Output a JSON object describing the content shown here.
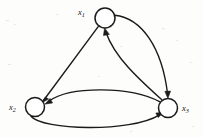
{
  "diagram": {
    "type": "directed-graph",
    "title": "",
    "background_color": "#fdfdfc",
    "stroke_color": "#1a1a1a",
    "node_fill": "#ffffff",
    "nodes": [
      {
        "id": "x1",
        "label": "x",
        "subscript": "1",
        "cx": 105,
        "cy": 18,
        "r": 10,
        "label_x": 78,
        "label_y": 15,
        "label_anchor": "start"
      },
      {
        "id": "x2",
        "label": "x",
        "subscript": "2",
        "cx": 35,
        "cy": 107,
        "r": 9.5,
        "label_x": 9,
        "label_y": 110,
        "label_anchor": "start"
      },
      {
        "id": "x3",
        "label": "x",
        "subscript": "3",
        "cx": 168,
        "cy": 108,
        "r": 9.5,
        "label_x": 182,
        "label_y": 111,
        "label_anchor": "start"
      }
    ],
    "edges": [
      {
        "id": "x1-to-x2",
        "from": "x1",
        "to": "x2",
        "style": "straight",
        "arrow_at": "x2"
      },
      {
        "id": "x1-to-x3",
        "from": "x1",
        "to": "x3",
        "style": "curve-right-outer",
        "arrow_at": "x3"
      },
      {
        "id": "x3-to-x1",
        "from": "x3",
        "to": "x1",
        "style": "curve-inner",
        "arrow_at": "x1"
      },
      {
        "id": "x3-to-x2",
        "from": "x3",
        "to": "x2",
        "style": "curve-upper",
        "arrow_at": "x2"
      },
      {
        "id": "x2-to-x3",
        "from": "x2",
        "to": "x3",
        "style": "curve-lower",
        "arrow_at": "x3"
      }
    ]
  }
}
